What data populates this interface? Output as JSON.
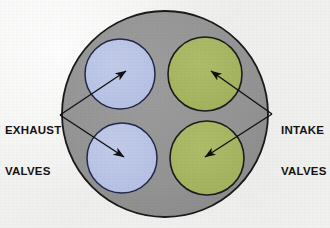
{
  "diagram": {
    "background_color": "#f3f3f2",
    "cylinder": {
      "name": "cylinder-bore",
      "fill_color": "#949494",
      "stroke_color": "#1a1a1a",
      "center_x": 165,
      "center_y": 114,
      "radius": 103
    },
    "valves": [
      {
        "id": "exhaust-valve-upper-left",
        "type": "exhaust",
        "fill_color": "#b9c4e6",
        "stroke_color": "#22294a",
        "cx": 120,
        "cy": 74,
        "r": 35
      },
      {
        "id": "exhaust-valve-lower-left",
        "type": "exhaust",
        "fill_color": "#b9c4e6",
        "stroke_color": "#22294a",
        "cx": 122,
        "cy": 158,
        "r": 35
      },
      {
        "id": "intake-valve-upper-right",
        "type": "intake",
        "fill_color": "#a6b662",
        "stroke_color": "#1c1c1c",
        "cx": 205,
        "cy": 74,
        "r": 37
      },
      {
        "id": "intake-valve-lower-right",
        "type": "intake",
        "fill_color": "#a6b662",
        "stroke_color": "#1c1c1c",
        "cx": 207,
        "cy": 158,
        "r": 37
      }
    ],
    "labels": {
      "exhaust": {
        "line1": "EXHAUST",
        "line2": "VALVES",
        "side": "left",
        "color": "#131313"
      },
      "intake": {
        "line1": "INTAKE",
        "line2": "VALVES",
        "side": "right",
        "color": "#131313"
      }
    },
    "leader_lines": {
      "stroke_color": "#111111",
      "stroke_width": 1.4,
      "exhaust_vertex_x": 60,
      "exhaust_vertex_y": 115,
      "intake_vertex_x": 272,
      "intake_vertex_y": 114,
      "arrows": [
        {
          "id": "arrow-exhaust-upper",
          "from_x": 60,
          "from_y": 115,
          "to_x": 126,
          "to_y": 71
        },
        {
          "id": "arrow-exhaust-lower",
          "from_x": 60,
          "from_y": 115,
          "to_x": 124,
          "to_y": 157
        },
        {
          "id": "arrow-intake-upper",
          "from_x": 272,
          "from_y": 114,
          "to_x": 211,
          "to_y": 71
        },
        {
          "id": "arrow-intake-lower",
          "from_x": 272,
          "from_y": 114,
          "to_x": 205,
          "to_y": 157
        }
      ]
    }
  }
}
